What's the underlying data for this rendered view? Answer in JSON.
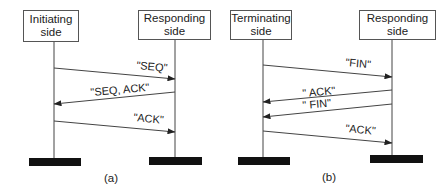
{
  "diagrams": [
    {
      "caption": "(a)",
      "left_entity": {
        "line1": "Initiating",
        "line2": "side"
      },
      "right_entity": {
        "line1": "Responding",
        "line2": "side"
      },
      "messages": [
        {
          "label": "\"SEQ\"",
          "direction": "left-to-right"
        },
        {
          "label": "\"SEQ, ACK\"",
          "direction": "right-to-left"
        },
        {
          "label": "\"ACK\"",
          "direction": "left-to-right"
        }
      ]
    },
    {
      "caption": "(b)",
      "left_entity": {
        "line1": "Terminating",
        "line2": "side"
      },
      "right_entity": {
        "line1": "Responding",
        "line2": "side"
      },
      "messages": [
        {
          "label": "\"FIN\"",
          "direction": "left-to-right"
        },
        {
          "label": "\" ACK\"",
          "direction": "right-to-left"
        },
        {
          "label": "\" FIN\"",
          "direction": "right-to-left"
        },
        {
          "label": "\"ACK\"",
          "direction": "left-to-right"
        }
      ]
    }
  ],
  "colors": {
    "line": "#444444",
    "bar": "#111111",
    "box_border": "#555555",
    "text": "#222222"
  }
}
